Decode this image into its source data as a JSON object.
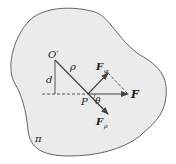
{
  "diagram": {
    "plane_label": "π",
    "origin_label": "O′",
    "distance_label": "d",
    "radius_label": "ρ",
    "point_label": "P",
    "angle_label": "θ",
    "force_label": "F",
    "force_phi_label": "F",
    "force_phi_sub": "φ",
    "force_rho_label": "F",
    "force_rho_sub": "ρ",
    "colors": {
      "region_fill": "#ebebeb",
      "outline": "#555555",
      "lines": "#444444"
    }
  }
}
